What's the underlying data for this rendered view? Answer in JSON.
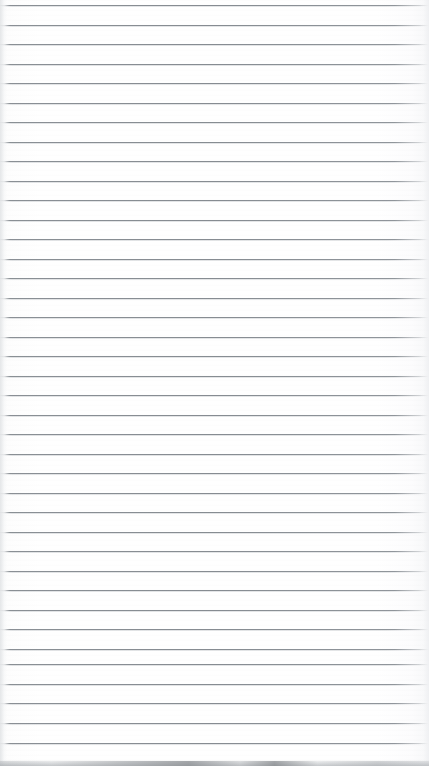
{
  "page": {
    "kind": "scanned-lined-paper",
    "width_px": 429,
    "height_px": 766,
    "has_text_content": false,
    "text_content": "",
    "background_color": "#fefefe",
    "rule_color": "#868c92",
    "rule_count": 39,
    "rule_spacing_px": 19.5,
    "first_rule_y_px": 5,
    "rule_thickness_px": 1,
    "margin_line": "none",
    "edge_shadow_color": "#b4b8bc"
  },
  "rules": [
    {
      "index": 1,
      "y": 5
    },
    {
      "index": 2,
      "y": 25
    },
    {
      "index": 3,
      "y": 44
    },
    {
      "index": 4,
      "y": 64
    },
    {
      "index": 5,
      "y": 83
    },
    {
      "index": 6,
      "y": 103
    },
    {
      "index": 7,
      "y": 122
    },
    {
      "index": 8,
      "y": 142
    },
    {
      "index": 9,
      "y": 161
    },
    {
      "index": 10,
      "y": 181
    },
    {
      "index": 11,
      "y": 200
    },
    {
      "index": 12,
      "y": 220
    },
    {
      "index": 13,
      "y": 239
    },
    {
      "index": 14,
      "y": 259
    },
    {
      "index": 15,
      "y": 278
    },
    {
      "index": 16,
      "y": 298
    },
    {
      "index": 17,
      "y": 317
    },
    {
      "index": 18,
      "y": 337
    },
    {
      "index": 19,
      "y": 356
    },
    {
      "index": 20,
      "y": 376
    },
    {
      "index": 21,
      "y": 395
    },
    {
      "index": 22,
      "y": 415
    },
    {
      "index": 23,
      "y": 434
    },
    {
      "index": 24,
      "y": 454
    },
    {
      "index": 25,
      "y": 473
    },
    {
      "index": 26,
      "y": 493
    },
    {
      "index": 27,
      "y": 512
    },
    {
      "index": 28,
      "y": 532
    },
    {
      "index": 29,
      "y": 551
    },
    {
      "index": 30,
      "y": 571
    },
    {
      "index": 31,
      "y": 590
    },
    {
      "index": 32,
      "y": 610
    },
    {
      "index": 33,
      "y": 629
    },
    {
      "index": 34,
      "y": 649
    },
    {
      "index": 35,
      "y": 664
    },
    {
      "index": 36,
      "y": 684
    },
    {
      "index": 37,
      "y": 703
    },
    {
      "index": 38,
      "y": 723
    },
    {
      "index": 39,
      "y": 743
    }
  ]
}
